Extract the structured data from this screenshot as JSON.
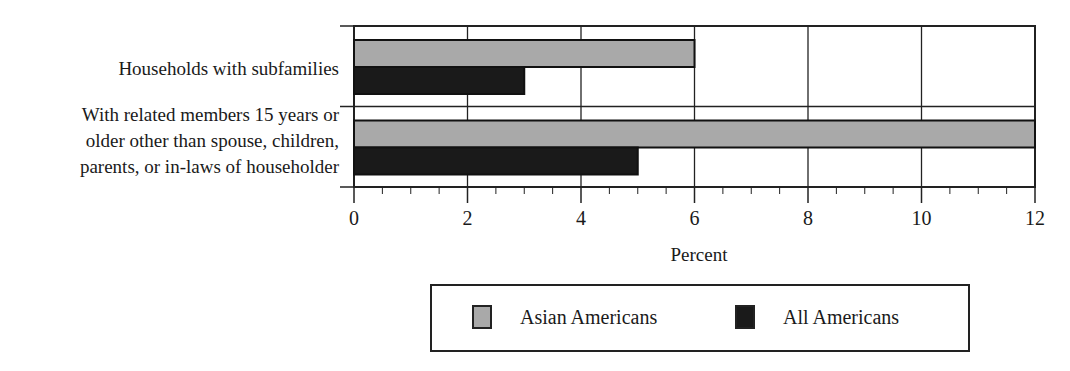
{
  "chart_data": {
    "type": "bar",
    "orientation": "horizontal",
    "title": "",
    "categories": [
      "Households with subfamilies",
      "With related members 15 years or older other than spouse, children, parents, or in-laws of householder"
    ],
    "category_label_lines": [
      [
        "Households with subfamilies"
      ],
      [
        "With related members 15 years or",
        "older other than spouse, children,",
        "parents, or in-laws of householder"
      ]
    ],
    "series": [
      {
        "name": "Asian Americans",
        "color": "#a9a9a9",
        "values": [
          6,
          12
        ]
      },
      {
        "name": "All Americans",
        "color": "#1a1a1a",
        "values": [
          3,
          5
        ]
      }
    ],
    "xlabel": "Percent",
    "ylabel": "",
    "xlim": [
      0,
      12
    ],
    "x_ticks": [
      "0",
      "2",
      "4",
      "6",
      "8",
      "10",
      "12"
    ],
    "minor_tick_step": 0.5,
    "grid": true,
    "legend_position": "bottom"
  },
  "legend": {
    "items": [
      {
        "label": "Asian Americans",
        "swatch": "gray"
      },
      {
        "label": "All Americans",
        "swatch": "black"
      }
    ]
  }
}
